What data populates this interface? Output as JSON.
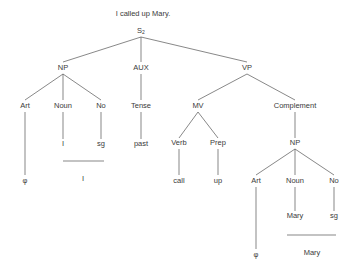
{
  "title": "I called up Mary.",
  "root": {
    "label": "S",
    "subscript": "2"
  },
  "nodes": {
    "np": "NP",
    "aux": "AUX",
    "vp": "VP",
    "np_art": "Art",
    "np_noun": "Noun",
    "np_no": "No",
    "tense": "Tense",
    "mv": "MV",
    "complement": "Complement",
    "np_art_val": "φ",
    "np_noun_val": "I",
    "np_no_val": "sg",
    "tense_val": "past",
    "verb": "Verb",
    "prep": "Prep",
    "c_np": "NP",
    "verb_val": "call",
    "prep_val": "up",
    "c_art": "Art",
    "c_noun": "Noun",
    "c_no": "No",
    "c_noun_val": "Mary",
    "c_no_val": "sg",
    "c_art_val": "φ",
    "np_surface": "I",
    "c_surface": "Mary"
  },
  "line_color": "#555555"
}
